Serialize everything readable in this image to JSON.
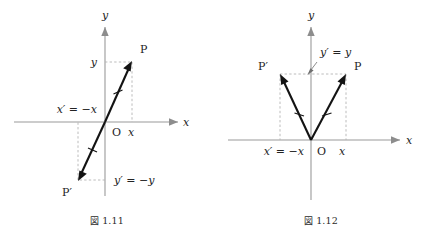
{
  "document": {
    "type": "textbook-figure-pair",
    "background_color": "#ffffff",
    "ink_color": "#131313",
    "axis_color": "#9a9a9a",
    "guide_color": "#b4b4b4"
  },
  "figures": [
    {
      "id": "fig-1-11",
      "caption_kanji": "図",
      "caption_number": "1.11",
      "caption_full": "図 1.11",
      "description": "point reflection through the origin",
      "axes": {
        "x_label": "x",
        "y_label": "y",
        "origin_label": "O"
      },
      "points": [
        {
          "name": "P",
          "label": "P",
          "x": 1.0,
          "y": 1.0
        },
        {
          "name": "P'",
          "label": "P′",
          "x": -1.0,
          "y": -1.0
        }
      ],
      "annotations": [
        {
          "name": "y-coordinate",
          "text": "y"
        },
        {
          "name": "x-coordinate",
          "text": "x"
        },
        {
          "name": "x-prime-equation",
          "text": "x′ = −x"
        },
        {
          "name": "y-prime-equation",
          "text": "y′ = −y"
        }
      ]
    },
    {
      "id": "fig-1-12",
      "caption_kanji": "図",
      "caption_number": "1.12",
      "caption_full": "図 1.12",
      "description": "mirror reflection across the y-axis",
      "axes": {
        "x_label": "x",
        "y_label": "y",
        "origin_label": "O"
      },
      "points": [
        {
          "name": "P",
          "label": "P",
          "x": 1.0,
          "y": 1.0
        },
        {
          "name": "P'",
          "label": "P′",
          "x": -1.0,
          "y": 1.0
        }
      ],
      "annotations": [
        {
          "name": "x-coordinate",
          "text": "x"
        },
        {
          "name": "x-prime-equation",
          "text": "x′ = −x"
        },
        {
          "name": "y-prime-equation",
          "text": "y′ = y"
        }
      ]
    }
  ]
}
